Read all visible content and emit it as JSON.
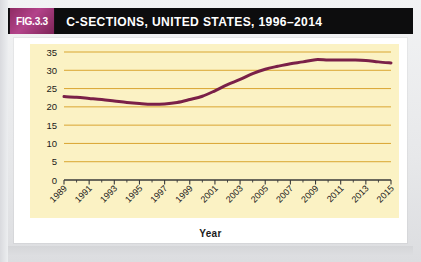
{
  "header": {
    "figure_badge": "FIG.3.3",
    "title": "C-SECTIONS, UNITED STATES, 1996–2014"
  },
  "axes": {
    "y_title": "Per 100",
    "x_title": "Year"
  },
  "colors": {
    "header_bar": "#0d0d0e",
    "badge_magenta": "#b3438a",
    "plot_background": "#fbf2c4",
    "gridline": "#d9a22a",
    "line_series": "#7a2048",
    "axis": "#3a3a3a",
    "card": "#ffffff",
    "page": "#e9eaec"
  },
  "chart_data": {
    "type": "line",
    "title": "C-SECTIONS, UNITED STATES, 1996–2014",
    "xlabel": "Year",
    "ylabel": "Per 100",
    "xlim": [
      1989,
      2015
    ],
    "ylim": [
      0,
      35
    ],
    "grid": true,
    "legend": null,
    "y_ticks": [
      0,
      5,
      10,
      15,
      20,
      25,
      30,
      35
    ],
    "x_ticks": [
      1989,
      1991,
      1993,
      1995,
      1997,
      1999,
      2001,
      2003,
      2005,
      2007,
      2009,
      2011,
      2013,
      2015
    ],
    "x_tick_labels": [
      "1989",
      "1991",
      "1993",
      "1995",
      "1997",
      "1999",
      "2001",
      "2003",
      "2005",
      "2007",
      "2009",
      "2011",
      "2013",
      "2015"
    ],
    "x_minor_ticks": [
      1990,
      1992,
      1994,
      1996,
      1998,
      2000,
      2002,
      2004,
      2006,
      2008,
      2010,
      2012,
      2014
    ],
    "series": [
      {
        "name": "Cesarean delivery rate",
        "color": "#7a2048",
        "x": [
          1989,
          1990,
          1991,
          1992,
          1993,
          1994,
          1995,
          1996,
          1997,
          1998,
          1999,
          2000,
          2001,
          2002,
          2003,
          2004,
          2005,
          2006,
          2007,
          2008,
          2009,
          2010,
          2011,
          2012,
          2013,
          2014,
          2015
        ],
        "values": [
          22.8,
          22.6,
          22.3,
          22.0,
          21.6,
          21.2,
          20.9,
          20.7,
          20.8,
          21.2,
          22.0,
          22.9,
          24.4,
          26.1,
          27.5,
          29.1,
          30.3,
          31.1,
          31.8,
          32.3,
          32.9,
          32.8,
          32.8,
          32.8,
          32.7,
          32.3,
          32.0
        ]
      }
    ]
  }
}
